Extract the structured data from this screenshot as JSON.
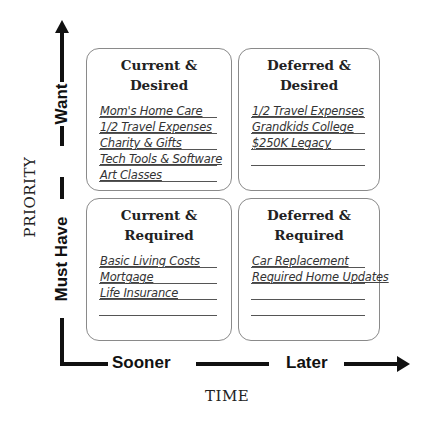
{
  "y_axis": {
    "title": "PRIORITY",
    "low_label": "Must Have",
    "high_label": "Want"
  },
  "x_axis": {
    "title": "TIME",
    "low_label": "Sooner",
    "high_label": "Later"
  },
  "quadrants": {
    "current_desired": {
      "title_line1": "Current &",
      "title_line2": "Desired",
      "items": [
        "Mom's Home Care",
        "1/2 Travel Expenses",
        "Charity & Gifts",
        "Tech Tools & Software",
        "Art Classes"
      ]
    },
    "deferred_desired": {
      "title_line1": "Deferred &",
      "title_line2": "Desired",
      "items": [
        "1/2 Travel Expenses",
        "Grandkids College",
        "$250K Legacy",
        ""
      ]
    },
    "current_required": {
      "title_line1": "Current &",
      "title_line2": "Required",
      "items": [
        "Basic Living Costs",
        "Mortgage",
        "Life Insurance",
        ""
      ]
    },
    "deferred_required": {
      "title_line1": "Deferred &",
      "title_line2": "Required",
      "items": [
        "Car Replacement",
        "Required Home Updates",
        "",
        ""
      ]
    }
  },
  "colors": {
    "axis": "#111111",
    "box_border": "#8a8a8a",
    "text": "#222222"
  }
}
